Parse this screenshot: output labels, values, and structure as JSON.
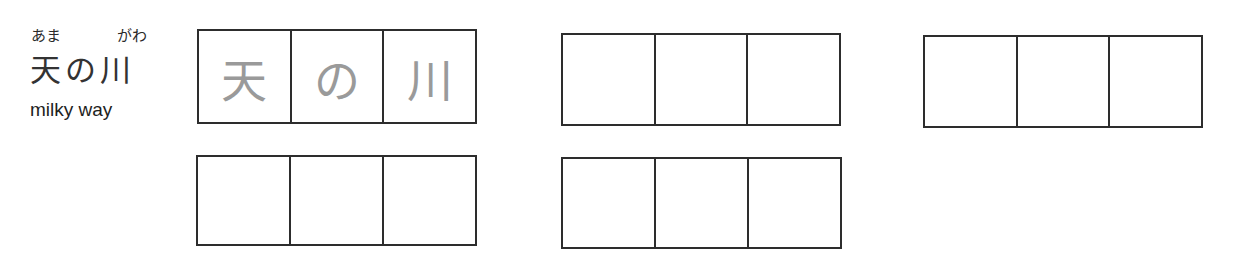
{
  "vocab": {
    "furigana": {
      "first": "あま",
      "second": "がわ"
    },
    "word": "天の川",
    "meaning": "milky way"
  },
  "practice_rows": [
    {
      "row": 1,
      "groups": [
        {
          "id": "g1",
          "cells": [
            "天",
            "の",
            "川"
          ],
          "style": "trace-guide",
          "guide_color": "#9a9a9a"
        },
        {
          "id": "g2",
          "cells": [
            "",
            "",
            ""
          ]
        },
        {
          "id": "g3",
          "cells": [
            "",
            "",
            ""
          ]
        }
      ]
    },
    {
      "row": 2,
      "groups": [
        {
          "id": "g4",
          "cells": [
            "",
            "",
            ""
          ]
        },
        {
          "id": "g5",
          "cells": [
            "",
            "",
            ""
          ]
        }
      ]
    }
  ],
  "colors": {
    "border": "#2d2d2d",
    "trace_text": "#9a9a9a",
    "text": "#222222",
    "background": "#ffffff"
  }
}
